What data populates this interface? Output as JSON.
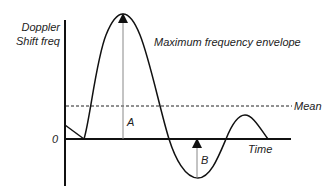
{
  "diagram": {
    "y_axis_label_line1": "Doppler",
    "y_axis_label_line2": "Shift freq",
    "zero_label": "0",
    "x_axis_label": "Time",
    "envelope_label": "Maximum frequency envelope",
    "mean_label": "Mean",
    "marker_a": "A",
    "marker_b": "B",
    "colors": {
      "line": "#111111",
      "thin_line": "#888888",
      "text": "#222222"
    }
  }
}
